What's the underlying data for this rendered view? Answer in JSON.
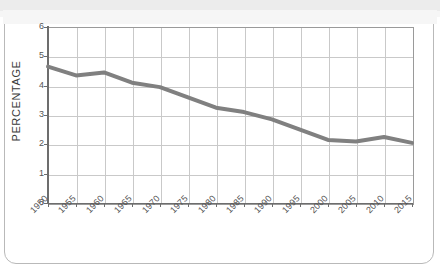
{
  "figure": {
    "background_color": "#ffffff",
    "frame_color": "#b9b9b9",
    "axis_color": "#6d6d6d",
    "grid_color": "#c9c9c9"
  },
  "chart_data": {
    "type": "line",
    "title": "",
    "xlabel": "",
    "ylabel": "PERCENTAGE",
    "categories": [
      "1950",
      "1955",
      "1960",
      "1965",
      "1970",
      "1975",
      "1980",
      "1985",
      "1990",
      "1995",
      "2000",
      "2005",
      "2010",
      "2015"
    ],
    "values": [
      4.65,
      4.35,
      4.45,
      4.1,
      3.95,
      3.6,
      3.25,
      3.1,
      2.85,
      2.5,
      2.15,
      2.1,
      2.25,
      2.05
    ],
    "series": [
      {
        "name": "Percentage",
        "color": "#808080",
        "line_width": 4,
        "values": [
          4.65,
          4.35,
          4.45,
          4.1,
          3.95,
          3.6,
          3.25,
          3.1,
          2.85,
          2.5,
          2.15,
          2.1,
          2.25,
          2.05
        ]
      }
    ],
    "ylim": [
      0,
      6
    ],
    "yticks": [
      "0",
      "1",
      "2",
      "3",
      "4",
      "5",
      "6"
    ],
    "xticks": [
      "1950",
      "1955",
      "1960",
      "1965",
      "1970",
      "1975",
      "1980",
      "1985",
      "1990",
      "1995",
      "2000",
      "2005",
      "2010",
      "2015"
    ],
    "grid": true,
    "legend": "none",
    "xtick_rotation": -45
  }
}
